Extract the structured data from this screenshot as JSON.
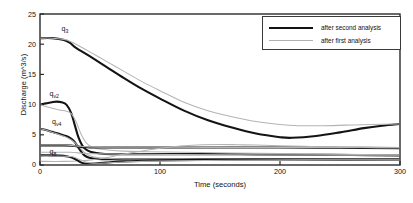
{
  "chart_data": {
    "type": "line",
    "title": "",
    "xlabel": "Time (seconds)",
    "ylabel": "Discharge (m^3/s)",
    "xlim": [
      0,
      300
    ],
    "ylim": [
      0,
      25
    ],
    "xticks": [
      "0",
      "100",
      "200",
      "300"
    ],
    "yticks": [
      "0",
      "5",
      "10",
      "15",
      "20",
      "25"
    ],
    "grid": false,
    "legend_position": "top-right",
    "legend": [
      {
        "label": "after second analysis",
        "style": "thick-black",
        "color": "#111111"
      },
      {
        "label": "after first analysis",
        "style": "thin-gray",
        "color": "#b0b0b0"
      }
    ],
    "annotations": [
      {
        "text": "q3",
        "base": "q",
        "sub": "3",
        "x": 18,
        "y": 22.3
      },
      {
        "text": "qv2",
        "base": "q",
        "sub": "v2",
        "x": 8,
        "y": 11.6
      },
      {
        "text": "qv4",
        "base": "q",
        "sub": "v4",
        "x": 10,
        "y": 6.9
      },
      {
        "text": "q8",
        "base": "q",
        "sub": "8",
        "x": 8,
        "y": 2.0
      }
    ],
    "series": [
      {
        "name": "q3 after second analysis",
        "style": "thick-black",
        "x": [
          0,
          10,
          20,
          25,
          30,
          40,
          55,
          70,
          85,
          100,
          120,
          140,
          160,
          180,
          200,
          210,
          230,
          250,
          270,
          285,
          300
        ],
        "y": [
          21.0,
          21.0,
          20.7,
          20.2,
          19.4,
          18.2,
          16.3,
          14.4,
          12.6,
          11.0,
          9.0,
          7.4,
          6.2,
          5.2,
          4.6,
          4.5,
          4.8,
          5.4,
          6.1,
          6.5,
          6.8
        ]
      },
      {
        "name": "q3 after first analysis",
        "style": "thin-gray",
        "x": [
          0,
          10,
          20,
          25,
          30,
          40,
          55,
          70,
          85,
          100,
          120,
          140,
          160,
          180,
          200,
          215,
          235,
          255,
          275,
          300
        ],
        "y": [
          21.0,
          21.0,
          20.8,
          20.5,
          20.0,
          18.9,
          17.2,
          15.5,
          13.8,
          12.3,
          10.4,
          9.0,
          8.0,
          7.2,
          6.7,
          6.5,
          6.5,
          6.6,
          6.7,
          6.8
        ]
      },
      {
        "name": "qv2 after second analysis",
        "style": "thick-black",
        "x": [
          0,
          5,
          10,
          14,
          18,
          22,
          26,
          29,
          32,
          35,
          38,
          42,
          50,
          60,
          80,
          100,
          140,
          180,
          220,
          260,
          300
        ],
        "y": [
          10.0,
          10.2,
          10.4,
          10.5,
          10.4,
          10.0,
          8.6,
          6.6,
          4.6,
          3.3,
          2.6,
          2.2,
          1.9,
          1.8,
          1.8,
          1.8,
          1.8,
          1.75,
          1.7,
          1.65,
          1.6
        ]
      },
      {
        "name": "qv2 after first analysis",
        "style": "thin-gray",
        "x": [
          0,
          8,
          16,
          22,
          26,
          30,
          34,
          38,
          42,
          48,
          56,
          70,
          90,
          120,
          160,
          200,
          240,
          300
        ],
        "y": [
          10.0,
          9.5,
          9.1,
          8.9,
          8.5,
          7.2,
          5.2,
          3.8,
          3.1,
          2.7,
          2.5,
          2.3,
          2.2,
          2.1,
          2.0,
          1.9,
          1.8,
          1.7
        ]
      },
      {
        "name": "qv4 after second analysis",
        "style": "thick-black",
        "x": [
          0,
          5,
          10,
          15,
          20,
          24,
          28,
          31,
          34,
          37,
          41,
          48,
          60,
          80,
          110,
          150,
          200,
          250,
          300
        ],
        "y": [
          6.0,
          5.8,
          5.5,
          5.2,
          4.9,
          4.6,
          4.0,
          3.2,
          2.3,
          1.6,
          1.2,
          1.0,
          0.95,
          0.95,
          0.95,
          0.95,
          0.95,
          0.92,
          0.9
        ]
      },
      {
        "name": "qv4 after first analysis",
        "style": "thin-gray",
        "x": [
          0,
          6,
          12,
          18,
          24,
          29,
          33,
          37,
          42,
          50,
          62,
          80,
          110,
          150,
          200,
          250,
          300
        ],
        "y": [
          6.0,
          5.7,
          5.3,
          4.9,
          4.4,
          3.7,
          2.9,
          2.1,
          1.5,
          1.2,
          1.05,
          1.0,
          1.0,
          1.0,
          1.0,
          0.95,
          0.9
        ]
      },
      {
        "name": "upper flat after second analysis",
        "style": "thick-black",
        "x": [
          0,
          10,
          20,
          26,
          30,
          34,
          38,
          44,
          55,
          70,
          100,
          150,
          200,
          250,
          300
        ],
        "y": [
          3.25,
          3.25,
          3.25,
          3.2,
          3.1,
          3.0,
          2.95,
          2.9,
          2.9,
          2.9,
          2.9,
          2.9,
          2.9,
          2.85,
          2.8
        ]
      },
      {
        "name": "rising gray branch",
        "style": "thin-gray",
        "x": [
          0,
          20,
          35,
          45,
          55,
          65,
          75,
          90,
          105,
          120,
          135,
          150,
          165,
          180,
          200,
          220,
          240,
          270,
          300
        ],
        "y": [
          0.6,
          0.6,
          0.7,
          0.9,
          1.2,
          1.6,
          2.0,
          2.5,
          2.9,
          3.2,
          3.35,
          3.4,
          3.35,
          3.3,
          3.2,
          3.1,
          3.0,
          2.9,
          2.85
        ]
      },
      {
        "name": "q8 after second analysis",
        "style": "thick-black",
        "x": [
          0,
          8,
          16,
          22,
          27,
          31,
          35,
          39,
          45,
          55,
          70,
          95,
          130,
          180,
          240,
          300
        ],
        "y": [
          1.6,
          1.6,
          1.55,
          1.45,
          1.2,
          0.8,
          0.35,
          0.2,
          0.25,
          0.4,
          0.6,
          0.75,
          0.85,
          0.9,
          0.9,
          0.9
        ]
      },
      {
        "name": "q8 after first analysis",
        "style": "thin-gray",
        "x": [
          0,
          10,
          20,
          27,
          32,
          37,
          42,
          50,
          65,
          85,
          115,
          160,
          220,
          300
        ],
        "y": [
          1.5,
          1.5,
          1.45,
          1.35,
          1.0,
          0.6,
          0.35,
          0.3,
          0.45,
          0.6,
          0.72,
          0.8,
          0.85,
          0.85
        ]
      },
      {
        "name": "mid flat gray",
        "style": "thin-gray",
        "x": [
          0,
          20,
          30,
          40,
          60,
          100,
          160,
          220,
          300
        ],
        "y": [
          3.3,
          3.3,
          3.15,
          3.0,
          2.95,
          2.95,
          2.9,
          2.9,
          2.85
        ]
      },
      {
        "name": "lower dotted band",
        "style": "thin-gray",
        "x": [
          0,
          25,
          35,
          45,
          70,
          110,
          160,
          220,
          300
        ],
        "y": [
          2.1,
          2.1,
          1.95,
          1.85,
          1.8,
          1.75,
          1.7,
          1.65,
          1.6
        ]
      }
    ]
  }
}
